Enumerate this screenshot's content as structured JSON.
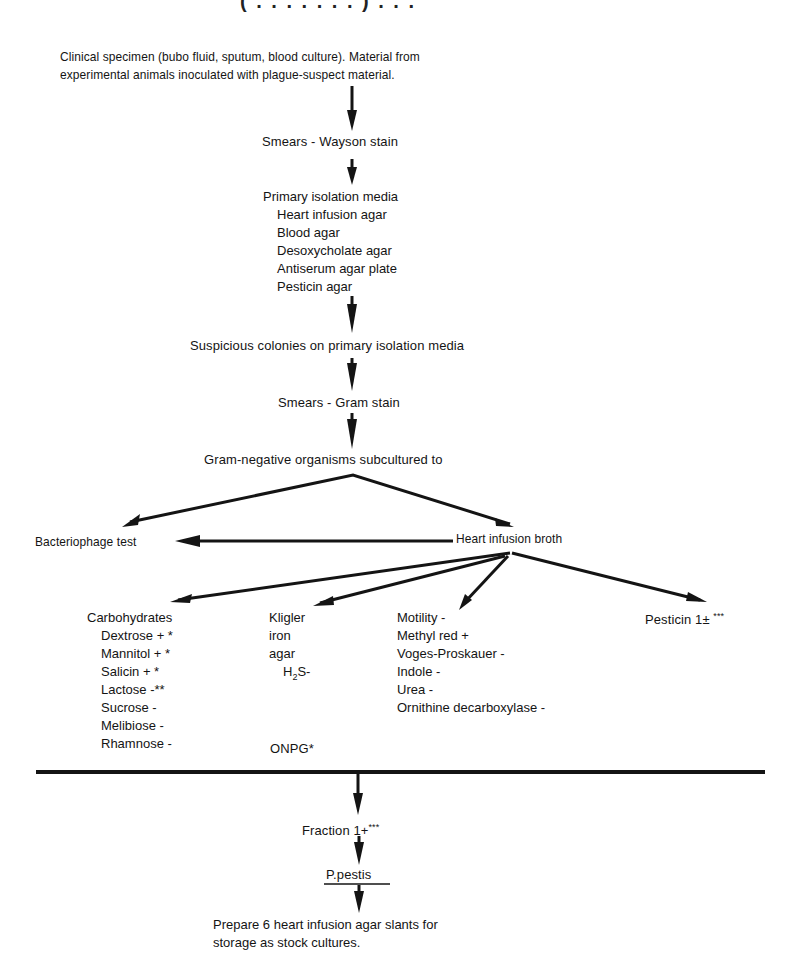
{
  "title_fragment": "(  .  .   .  .  .  .  .  )  .  .  .",
  "start": {
    "line1": "Clinical specimen (bubo fluid, sputum, blood culture). Material from",
    "line2": "experimental animals inoculated with plague-suspect material."
  },
  "steps": {
    "wayson": "Smears - Wayson stain",
    "primary_title": "Primary isolation media",
    "primary_media": [
      "Heart infusion agar",
      "Blood agar",
      "Desoxycholate agar",
      "Antiserum agar plate",
      "Pesticin agar"
    ],
    "suspicious": "Suspicious colonies on primary isolation media",
    "gram": "Smears - Gram stain",
    "gram_negative": "Gram-negative organisms subcultured to",
    "bacteriophage": "Bacteriophage test",
    "heart_broth": "Heart infusion broth"
  },
  "tests": {
    "carbohydrates": {
      "title": "Carbohydrates",
      "items": [
        "Dextrose + *",
        "Mannitol + *",
        "Salicin + *",
        "Lactose -**",
        "Sucrose -",
        "Melibiose -",
        "Rhamnose -"
      ]
    },
    "kligler": {
      "lines": [
        "Kligler",
        "iron",
        "agar"
      ],
      "h2s_prefix": "H",
      "h2s_sub": "2",
      "h2s_suffix": "S-",
      "onpg": "ONPG*"
    },
    "biochem": [
      "Motility -",
      "Methyl red +",
      "Voges-Proskauer -",
      "Indole -",
      "Urea -",
      "Ornithine decarboxylase -"
    ],
    "pesticin": {
      "label": "Pesticin 1",
      "sign": "±",
      "stars": "***"
    }
  },
  "final": {
    "fraction_label": "Fraction 1",
    "fraction_sign": "+",
    "fraction_stars": "***",
    "organism": "P.pestis",
    "prepare_line1": "Prepare 6 heart infusion agar slants for",
    "prepare_line2": "storage as stock cultures."
  }
}
